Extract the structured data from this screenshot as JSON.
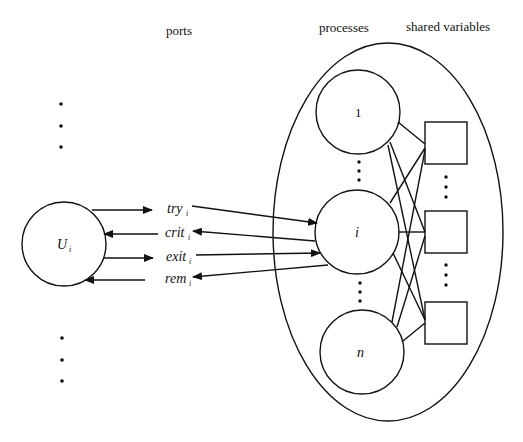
{
  "headers": {
    "ports": "ports",
    "processes": "processes",
    "shared_variables": "shared variables"
  },
  "user": {
    "label": "U",
    "subscript": "i"
  },
  "ports": [
    {
      "name": "try",
      "subscript": "i",
      "direction": "user-to-process"
    },
    {
      "name": "crit",
      "subscript": "i",
      "direction": "process-to-user"
    },
    {
      "name": "exit",
      "subscript": "i",
      "direction": "user-to-process"
    },
    {
      "name": "rem",
      "subscript": "i",
      "direction": "process-to-user"
    }
  ],
  "processes": [
    {
      "label": "1"
    },
    {
      "label": "i"
    },
    {
      "label": "n"
    }
  ],
  "shared_variables": {
    "count_visible": 3
  },
  "colors": {
    "stroke": "#111111",
    "background": "#ffffff"
  }
}
